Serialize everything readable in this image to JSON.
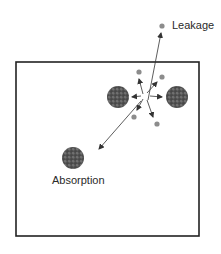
{
  "labels": {
    "leakage": "Leakage",
    "absorption": "Absorption"
  },
  "colors": {
    "box_border": "#222222",
    "nucleus": "#5a5a5a",
    "neutron": "#8c8c8c",
    "arrow": "#333333",
    "text": "#2a2a2a"
  },
  "diagram": {
    "box": {
      "x": 16,
      "y": 62,
      "width": 183,
      "height": 174
    },
    "fission_origin": {
      "x": 145,
      "y": 96
    },
    "nuclei": [
      {
        "name": "left-fission-fragment",
        "cx": 118,
        "cy": 97,
        "r": 11
      },
      {
        "name": "right-fission-fragment",
        "cx": 177,
        "cy": 97,
        "r": 11
      },
      {
        "name": "absorbing-nucleus",
        "cx": 73,
        "cy": 158,
        "r": 11
      }
    ],
    "neutrons": [
      {
        "name": "leakage-neutron",
        "cx": 162,
        "cy": 26
      },
      {
        "name": "neutron-upper-left",
        "cx": 139,
        "cy": 72
      },
      {
        "name": "neutron-upper-right",
        "cx": 162,
        "cy": 77
      },
      {
        "name": "neutron-lower-left",
        "cx": 134,
        "cy": 117
      },
      {
        "name": "neutron-lower-right",
        "cx": 157,
        "cy": 124
      }
    ]
  }
}
